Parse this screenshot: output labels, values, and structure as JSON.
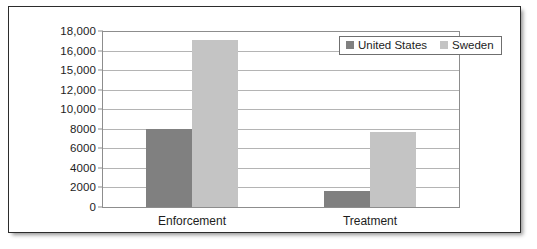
{
  "chart_data": {
    "type": "bar",
    "title": "",
    "subtitle": "",
    "xlabel": "",
    "ylabel": "",
    "categories": [
      "Enforcement",
      "Treatment"
    ],
    "series": [
      {
        "name": "United States",
        "color": "#808080",
        "values": [
          8000,
          1600
        ]
      },
      {
        "name": "Sweden",
        "color": "#c4c4c4",
        "values": [
          17100,
          7700
        ]
      }
    ],
    "ylim": [
      0,
      18000
    ],
    "ytick_values": [
      0,
      2000,
      4000,
      6000,
      8000,
      10000,
      12000,
      14000,
      16000,
      18000
    ],
    "ytick_labels": [
      "0",
      "2000",
      "4000",
      "6000",
      "8000",
      "10,000",
      "12,000",
      "15,000",
      "16,000",
      "18,000"
    ],
    "grid": true,
    "legend_position": "top-right"
  },
  "legend": {
    "entries": [
      {
        "label": "United States",
        "swatch": "legend-swatch-united-states"
      },
      {
        "label": "Sweden",
        "swatch": "legend-swatch-sweden"
      }
    ]
  },
  "colors": {
    "united_states": "#808080",
    "sweden": "#c4c4c4",
    "gridline": "#b4b4b4",
    "axis": "#8d8d8d",
    "frame": "#2c2c2c",
    "text": "#1d1d1d",
    "background": "#ffffff"
  }
}
